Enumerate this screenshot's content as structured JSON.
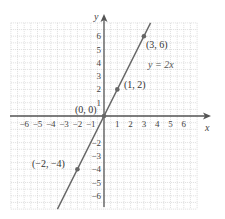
{
  "chart_data": {
    "type": "line",
    "title": "",
    "xlabel": "x",
    "ylabel": "y",
    "xlim": [
      -7,
      7
    ],
    "ylim": [
      -7,
      7
    ],
    "grid": true,
    "x_ticks": [
      -6,
      -5,
      -4,
      -3,
      -2,
      -1,
      1,
      2,
      3,
      4,
      5,
      6
    ],
    "y_ticks": [
      -6,
      -5,
      -4,
      -3,
      -2,
      1,
      2,
      3,
      4,
      5,
      6
    ],
    "x_tick_labels": [
      "−6",
      "−5",
      "−4",
      "−3",
      "−2",
      "−1",
      "1",
      "2",
      "3",
      "4",
      "5",
      "6"
    ],
    "y_tick_labels": [
      "−6",
      "−5",
      "−4",
      "−3",
      "−2",
      "1",
      "2",
      "3",
      "4",
      "5",
      "6"
    ],
    "series": [
      {
        "name": "y = 2x",
        "equation": "y = 2x",
        "color": "#666666",
        "x": [
          -3.5,
          3.5
        ],
        "y": [
          -7,
          7
        ]
      }
    ],
    "points": [
      {
        "x": 3,
        "y": 6,
        "label": "(3, 6)"
      },
      {
        "x": 1,
        "y": 2,
        "label": "(1, 2)"
      },
      {
        "x": 0,
        "y": 0,
        "label": "(0, 0)"
      },
      {
        "x": -2,
        "y": -4,
        "label": "(−2, −4)"
      }
    ],
    "annotations": [
      {
        "text": "y = 2x",
        "x": 4.1,
        "y": 4.2
      }
    ]
  },
  "labels": {
    "x_axis": "x",
    "y_axis": "y",
    "equation": "y = 2x",
    "p1": "(3, 6)",
    "p2": "(1, 2)",
    "p3": "(0, 0)",
    "p4": "(−2, −4)"
  },
  "colors": {
    "line": "#666666",
    "axis": "#555555",
    "grid": "#c9c9c9",
    "point": "#666666"
  }
}
